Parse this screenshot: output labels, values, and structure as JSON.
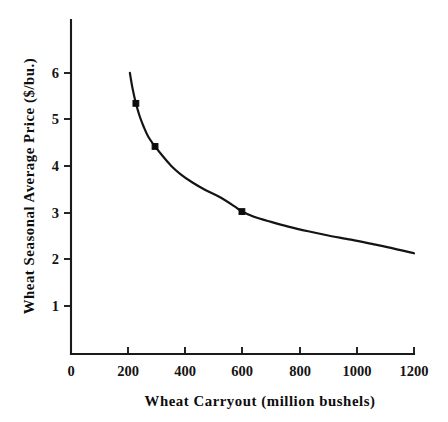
{
  "chart_data": {
    "type": "line",
    "title": "",
    "xlabel": "Wheat Carryout (million bushels)",
    "ylabel": "Wheat Seasonal Average Price ($/bu.)",
    "xlim": [
      0,
      1200
    ],
    "ylim": [
      0,
      6.6
    ],
    "grid": false,
    "legend": null,
    "xticks": [
      0,
      200,
      400,
      600,
      800,
      1000,
      1200
    ],
    "xtick_labels": [
      "0",
      "200",
      "400",
      "600",
      "800",
      "1000",
      "1200"
    ],
    "yticks": [
      1,
      2,
      3,
      4,
      5,
      6
    ],
    "ytick_labels": [
      "1",
      "2",
      "3",
      "4",
      "5",
      "6"
    ],
    "series": [
      {
        "name": "Wheat price vs carryout",
        "style": "solid-curve-with-markers",
        "x": [
          206,
          215,
          227,
          240,
          255,
          272,
          294,
          320,
          350,
          385,
          425,
          470,
          520,
          575,
          598,
          640,
          700,
          760,
          830,
          900,
          980,
          1060,
          1130,
          1200
        ],
        "y": [
          6.0,
          5.68,
          5.35,
          5.08,
          4.84,
          4.62,
          4.43,
          4.23,
          4.02,
          3.83,
          3.66,
          3.5,
          3.35,
          3.14,
          3.04,
          2.93,
          2.82,
          2.72,
          2.62,
          2.53,
          2.44,
          2.34,
          2.25,
          2.15
        ]
      }
    ],
    "markers": [
      {
        "x": 227,
        "y": 5.35
      },
      {
        "x": 294,
        "y": 4.43
      },
      {
        "x": 598,
        "y": 3.04
      }
    ],
    "colors": {
      "curve": "#141414",
      "marker": "#0d0d0d",
      "axis": "#1a1a1a",
      "text": "#0d0d0d",
      "background": "#ffffff"
    }
  }
}
